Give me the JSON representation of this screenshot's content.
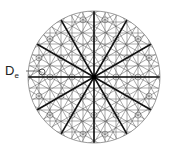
{
  "figure": {
    "label": {
      "main": "D",
      "subscript": "e"
    },
    "circle": {
      "cx": 94,
      "cy": 77,
      "r": 66
    },
    "spokes": {
      "count": 12,
      "angle_step_deg": 30,
      "color": "#111111",
      "width": 1.6
    },
    "grid": {
      "spacing": 11,
      "angles_deg": [
        0,
        30,
        60,
        90,
        120,
        150
      ],
      "color": "#555555",
      "width": 0.5
    },
    "node_circles": {
      "radius": 3,
      "color": "#666666"
    },
    "marker": {
      "cx": 42,
      "cy": 72,
      "r": 3
    },
    "boundary_color": "#888888"
  }
}
